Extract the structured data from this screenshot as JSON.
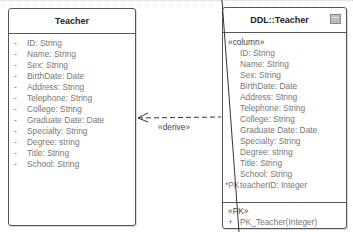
{
  "left_class": {
    "title": "Teacher",
    "attributes": [
      {
        "vis": "-",
        "text": "ID: String"
      },
      {
        "vis": "-",
        "text": "Name: String"
      },
      {
        "vis": "-",
        "text": "Sex: String"
      },
      {
        "vis": "-",
        "text": "BirthDate: Date"
      },
      {
        "vis": "-",
        "text": "Address: String"
      },
      {
        "vis": "-",
        "text": "Telephone: String"
      },
      {
        "vis": "-",
        "text": "College: String"
      },
      {
        "vis": "-",
        "text": "Graduate Date: Date"
      },
      {
        "vis": "-",
        "text": "Specialty: String"
      },
      {
        "vis": "-",
        "text": "Degree: string"
      },
      {
        "vis": "-",
        "text": "Title: String"
      },
      {
        "vis": "-",
        "text": "School: String"
      }
    ]
  },
  "right_class": {
    "title": "DDL::Teacher",
    "icon": "table-icon",
    "column_stereotype": "«column»",
    "columns": [
      {
        "vis": "",
        "text": "ID: String"
      },
      {
        "vis": "",
        "text": "Name: String"
      },
      {
        "vis": "",
        "text": "Sex: String"
      },
      {
        "vis": "",
        "text": "BirthDate: Date"
      },
      {
        "vis": "",
        "text": "Address: String"
      },
      {
        "vis": "",
        "text": "Telephone: String"
      },
      {
        "vis": "",
        "text": "College: String"
      },
      {
        "vis": "",
        "text": "Graduate Date: Date"
      },
      {
        "vis": "",
        "text": "Specialty: String"
      },
      {
        "vis": "",
        "text": "Degree: string"
      },
      {
        "vis": "",
        "text": "Title: String"
      },
      {
        "vis": "",
        "text": "School: String"
      },
      {
        "vis": "*PK",
        "text": "teacherID: Integer"
      }
    ],
    "pk_stereotype": "«PK»",
    "operations": [
      {
        "vis": "+",
        "text": "PK_Teacher(Integer)"
      }
    ]
  },
  "relation": {
    "label": "«derive»",
    "type": "dependency-dashed-arrow"
  }
}
